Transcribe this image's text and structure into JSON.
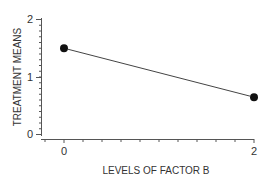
{
  "chart_data": {
    "type": "line",
    "title": "",
    "xlabel": "LEVELS OF FACTOR B",
    "ylabel": "TREATMENT MEANS",
    "x": [
      0,
      2
    ],
    "series": [
      {
        "name": "treatment means",
        "values": [
          1.5,
          0.65
        ]
      }
    ],
    "xticks": [
      "0",
      "2"
    ],
    "yticks": [
      "0",
      "1",
      "2"
    ],
    "xlim": [
      -0.2,
      2
    ],
    "ylim": [
      0,
      2
    ],
    "grid": false,
    "legend": "none",
    "colors": {
      "line": "#444444",
      "marker": "#111111",
      "axis": "#555555"
    }
  }
}
